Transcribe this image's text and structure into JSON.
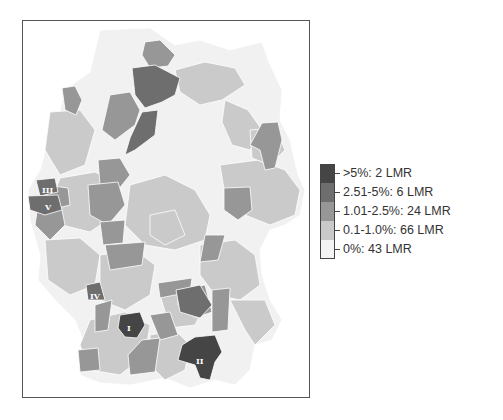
{
  "map": {
    "title": "",
    "colors": {
      "gt5": "#454545",
      "p2_5": "#6e6e6e",
      "p1_2_5": "#979797",
      "p0_1": "#c9c9c9",
      "zero": "#f4f4f4",
      "border": "#ffffff",
      "frame": "#555555"
    },
    "region_labels": [
      {
        "id": "I",
        "label": "I"
      },
      {
        "id": "II",
        "label": "II"
      },
      {
        "id": "III",
        "label": "III"
      },
      {
        "id": "IV",
        "label": "IV"
      },
      {
        "id": "V",
        "label": "V"
      }
    ]
  },
  "legend": {
    "items": [
      {
        "label": ">5%: 2 LMR",
        "color": "#454545"
      },
      {
        "label": "2.51-5%: 6 LMR",
        "color": "#6e6e6e"
      },
      {
        "label": "1.01-2.5%: 24 LMR",
        "color": "#979797"
      },
      {
        "label": "0.1-1.0%: 66 LMR",
        "color": "#c9c9c9"
      },
      {
        "label": "0%: 43 LMR",
        "color": "#f4f4f4"
      }
    ]
  }
}
